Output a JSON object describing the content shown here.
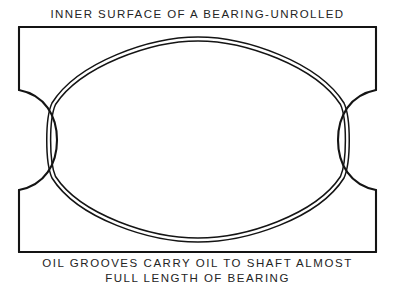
{
  "figure": {
    "title": "INNER SURFACE OF A BEARING-UNROLLED",
    "caption": {
      "line1": "OIL GROOVES CARRY OIL TO SHAFT ALMOST",
      "line2": "FULL LENGTH OF BEARING"
    }
  },
  "canvas": {
    "width": 395,
    "height": 301,
    "background": "#ffffff"
  },
  "style": {
    "ink": "#141414",
    "outline_width": 2.1,
    "groove_width": 1.5,
    "groove_gap": 3.6
  },
  "diagram": {
    "type": "engineering-line-drawing",
    "plate": {
      "left": 19,
      "top": 27,
      "right": 376,
      "bottom": 252,
      "description": "Rectangular unrolled bearing surface with concave semicircular oil-groove notches cut into the left and right edges."
    },
    "notches": [
      {
        "name": "left-oil-groove-notch",
        "side": "left",
        "edge_x": 19,
        "apex_x": 57,
        "top_y": 90,
        "bottom_y": 190,
        "bulge": "inward-right"
      },
      {
        "name": "right-oil-groove-notch",
        "side": "right",
        "edge_x": 376,
        "apex_x": 338,
        "top_y": 90,
        "bottom_y": 190,
        "bulge": "inward-left"
      }
    ],
    "groove": {
      "name": "elliptical-oil-groove",
      "rendering": "double-line",
      "left_x": 52,
      "right_x": 344,
      "top_y": 37,
      "bottom_y": 242,
      "junction_points": [
        {
          "x": 52,
          "y": 103
        },
        {
          "x": 52,
          "y": 178
        },
        {
          "x": 344,
          "y": 103
        },
        {
          "x": 344,
          "y": 178
        }
      ]
    }
  }
}
